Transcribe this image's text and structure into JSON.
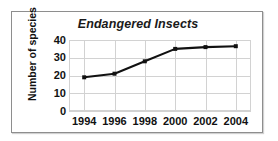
{
  "chart_data": {
    "type": "line",
    "title": "Endangered Insects",
    "xlabel": "",
    "ylabel": "Number of species",
    "categories": [
      "1994",
      "1996",
      "1998",
      "2000",
      "2002",
      "2004"
    ],
    "x": [
      1994,
      1996,
      1998,
      2000,
      2002,
      2004
    ],
    "values": [
      19,
      21,
      28,
      35,
      36,
      36.5
    ],
    "series": [
      {
        "name": "Number of species",
        "values": [
          19,
          21,
          28,
          35,
          36,
          36.5
        ]
      }
    ],
    "yticks": [
      0,
      10,
      20,
      30,
      40
    ],
    "ytick_labels": [
      "0",
      "10",
      "20",
      "30",
      "40"
    ],
    "xtick_labels": [
      "1994",
      "1996",
      "1998",
      "2000",
      "2002",
      "2004"
    ],
    "ylim": [
      0,
      40
    ],
    "xlim": [
      1993,
      2005
    ],
    "grid": true,
    "legend": false,
    "legend_position": "none",
    "marker": "square",
    "line_color": "#111111",
    "marker_color": "#111111",
    "grid_color": "#d2d2d2",
    "background_color": "#ffffff",
    "frame_color": "#8e8e8e"
  }
}
